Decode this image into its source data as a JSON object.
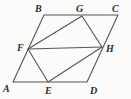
{
  "figure": {
    "kind": "geometry-diagram",
    "canvas": {
      "width": 131,
      "height": 99
    },
    "background_color": "#fbfbfa",
    "stroke_color": "#55555a",
    "stroke_width": 1.1,
    "label_color": "#2b2b2b",
    "points": {
      "A": {
        "x": 13,
        "y": 82
      },
      "B": {
        "x": 44,
        "y": 15
      },
      "C": {
        "x": 118,
        "y": 15
      },
      "D": {
        "x": 87,
        "y": 82
      },
      "E": {
        "x": 48,
        "y": 82
      },
      "F": {
        "x": 28,
        "y": 49
      },
      "G": {
        "x": 82,
        "y": 16
      },
      "H": {
        "x": 102,
        "y": 47
      }
    },
    "polygons": [
      {
        "name": "parallelogram-abcd",
        "vertices": [
          "A",
          "B",
          "C",
          "D"
        ]
      },
      {
        "name": "quadrilateral-fghe",
        "vertices": [
          "F",
          "G",
          "H",
          "E"
        ]
      }
    ],
    "segments": [
      {
        "name": "segment-fh",
        "from": "F",
        "to": "H"
      }
    ],
    "labels": [
      {
        "id": "A",
        "text": "A",
        "x": 3,
        "y": 84
      },
      {
        "id": "B",
        "text": "B",
        "x": 35,
        "y": 4
      },
      {
        "id": "C",
        "text": "C",
        "x": 112,
        "y": 4
      },
      {
        "id": "D",
        "text": "D",
        "x": 90,
        "y": 86
      },
      {
        "id": "E",
        "text": "E",
        "x": 45,
        "y": 86
      },
      {
        "id": "F",
        "text": "F",
        "x": 17,
        "y": 43
      },
      {
        "id": "G",
        "text": "G",
        "x": 76,
        "y": 4
      },
      {
        "id": "H",
        "text": "H",
        "x": 106,
        "y": 44
      }
    ]
  }
}
